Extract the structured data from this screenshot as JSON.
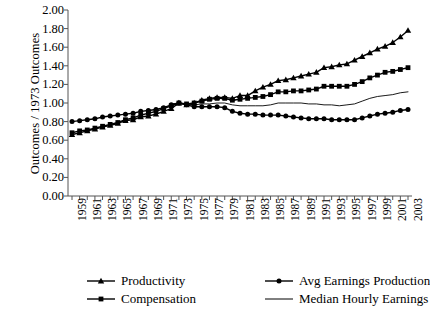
{
  "chart_data": {
    "type": "line",
    "title": "",
    "xlabel": "",
    "ylabel": "Outcomes / 1973 Outcomes",
    "ylim": [
      0.0,
      2.0
    ],
    "ytick_step": 0.2,
    "ytick_labels": [
      "0.00",
      "0.20",
      "0.40",
      "0.60",
      "0.80",
      "1.00",
      "1.20",
      "1.40",
      "1.60",
      "1.80",
      "2.00"
    ],
    "grid": false,
    "legend_position": "below-axes",
    "x": [
      1959,
      1960,
      1961,
      1962,
      1963,
      1964,
      1965,
      1966,
      1967,
      1968,
      1969,
      1970,
      1971,
      1972,
      1973,
      1974,
      1975,
      1976,
      1977,
      1978,
      1979,
      1980,
      1981,
      1982,
      1983,
      1984,
      1985,
      1986,
      1987,
      1988,
      1989,
      1990,
      1991,
      1992,
      1993,
      1994,
      1995,
      1996,
      1997,
      1998,
      1999,
      2000,
      2001,
      2002,
      2003
    ],
    "xtick_labels": [
      "1959",
      "1961",
      "1963",
      "1965",
      "1967",
      "1969",
      "1971",
      "1973",
      "1975",
      "1977",
      "1979",
      "1981",
      "1983",
      "1985",
      "1987",
      "1989",
      "1991",
      "1993",
      "1995",
      "1997",
      "1999",
      "2001",
      "2003"
    ],
    "xlim": [
      1959,
      2003
    ],
    "series": [
      {
        "name": "Productivity",
        "marker": "triangle",
        "values": [
          0.66,
          0.68,
          0.7,
          0.72,
          0.74,
          0.76,
          0.78,
          0.81,
          0.82,
          0.85,
          0.86,
          0.88,
          0.91,
          0.94,
          1.0,
          0.98,
          1.0,
          1.03,
          1.05,
          1.06,
          1.06,
          1.05,
          1.08,
          1.08,
          1.13,
          1.17,
          1.2,
          1.24,
          1.25,
          1.27,
          1.29,
          1.31,
          1.33,
          1.38,
          1.39,
          1.41,
          1.42,
          1.46,
          1.5,
          1.54,
          1.58,
          1.61,
          1.65,
          1.71,
          1.78
        ]
      },
      {
        "name": "Compensation",
        "marker": "square",
        "values": [
          0.68,
          0.7,
          0.71,
          0.73,
          0.75,
          0.77,
          0.79,
          0.82,
          0.84,
          0.87,
          0.89,
          0.91,
          0.94,
          0.97,
          1.0,
          0.99,
          1.0,
          1.02,
          1.04,
          1.05,
          1.05,
          1.03,
          1.04,
          1.05,
          1.06,
          1.07,
          1.09,
          1.12,
          1.12,
          1.13,
          1.13,
          1.14,
          1.15,
          1.18,
          1.18,
          1.18,
          1.18,
          1.2,
          1.23,
          1.27,
          1.3,
          1.33,
          1.34,
          1.36,
          1.38
        ]
      },
      {
        "name": "Avg Earnings Production",
        "marker": "circle",
        "values": [
          0.8,
          0.81,
          0.82,
          0.83,
          0.85,
          0.86,
          0.87,
          0.88,
          0.89,
          0.91,
          0.92,
          0.93,
          0.95,
          0.98,
          1.0,
          0.98,
          0.96,
          0.96,
          0.96,
          0.96,
          0.95,
          0.91,
          0.89,
          0.88,
          0.88,
          0.87,
          0.87,
          0.87,
          0.86,
          0.85,
          0.84,
          0.83,
          0.83,
          0.83,
          0.82,
          0.82,
          0.82,
          0.82,
          0.84,
          0.86,
          0.88,
          0.89,
          0.9,
          0.92,
          0.93
        ]
      },
      {
        "name": "Median Hourly Earnings",
        "marker": "none",
        "values": [
          null,
          null,
          null,
          null,
          null,
          null,
          null,
          null,
          null,
          null,
          null,
          null,
          null,
          0.99,
          1.0,
          0.99,
          0.98,
          0.99,
          0.99,
          1.0,
          1.0,
          0.98,
          0.97,
          0.97,
          0.97,
          0.97,
          0.98,
          1.0,
          1.0,
          1.0,
          1.0,
          0.99,
          0.99,
          0.98,
          0.98,
          0.97,
          0.98,
          0.99,
          1.02,
          1.05,
          1.07,
          1.08,
          1.09,
          1.11,
          1.12
        ]
      }
    ]
  },
  "axis": {
    "y_title": "Outcomes / 1973 Outcomes"
  },
  "legend": {
    "items": [
      {
        "label": "Productivity",
        "marker": "triangle"
      },
      {
        "label": "Avg Earnings Production",
        "marker": "circle"
      },
      {
        "label": "Compensation",
        "marker": "square"
      },
      {
        "label": "Median Hourly Earnings",
        "marker": "none"
      }
    ]
  },
  "colors": {
    "ink": "#000000",
    "background": "#ffffff",
    "axis": "#555555",
    "thin_line": "#444444"
  }
}
